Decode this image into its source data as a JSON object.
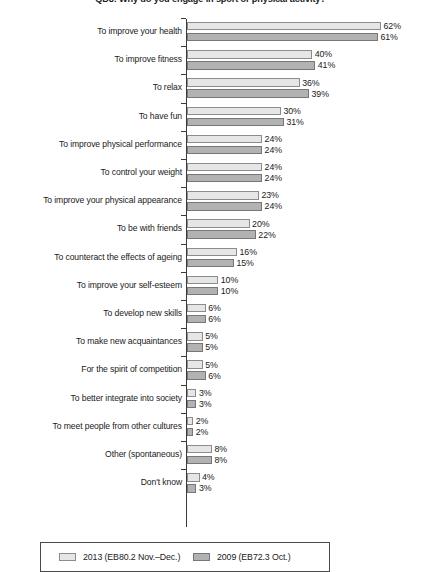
{
  "chart_data": {
    "type": "bar",
    "orientation": "horizontal",
    "title": "QD8: Why do you engage in sport or physical activity?",
    "xlabel": "",
    "ylabel": "",
    "xlim": [
      0,
      62
    ],
    "grid": false,
    "legend_position": "bottom",
    "value_suffix": "%",
    "categories": [
      "To improve your health",
      "To improve fitness",
      "To relax",
      "To have fun",
      "To improve physical performance",
      "To control your weight",
      "To improve your physical appearance",
      "To be with friends",
      "To counteract the effects of ageing",
      "To improve your self-esteem",
      "To develop new skills",
      "To make new acquaintances",
      "For the spirit of competition",
      "To better integrate into society",
      "To meet people from other cultures",
      "Other (spontaneous)",
      "Don't know"
    ],
    "series": [
      {
        "name": "2013 (EB80.2 Nov.–Dec.)",
        "color": "#e6e6e6",
        "values": [
          62,
          40,
          36,
          30,
          24,
          24,
          23,
          20,
          16,
          10,
          6,
          5,
          5,
          3,
          2,
          8,
          4
        ],
        "labels": [
          "62%",
          "40%",
          "36%",
          "30%",
          "24%",
          "24%",
          "23%",
          "20%",
          "16%",
          "10%",
          "6%",
          "5%",
          "5%",
          "3%",
          "2%",
          "8%",
          "4%"
        ]
      },
      {
        "name": "2009 (EB72.3 Oct.)",
        "color": "#b2b2b2",
        "values": [
          61,
          41,
          39,
          31,
          24,
          24,
          24,
          22,
          15,
          10,
          6,
          5,
          6,
          3,
          2,
          8,
          3
        ],
        "labels": [
          "61%",
          "41%",
          "39%",
          "31%",
          "24%",
          "24%",
          "24%",
          "22%",
          "15%",
          "10%",
          "6%",
          "5%",
          "6%",
          "3%",
          "2%",
          "8%",
          "3%"
        ]
      }
    ]
  },
  "legend": {
    "items": [
      {
        "label": "2013 (EB80.2 Nov.–Dec.)"
      },
      {
        "label": "2009 (EB72.3 Oct.)"
      }
    ]
  }
}
